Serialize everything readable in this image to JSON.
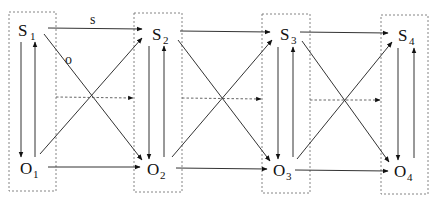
{
  "diagram": {
    "type": "state-observation transition diagram",
    "edge_labels": {
      "s": "s",
      "o": "o"
    },
    "time_slices": [
      {
        "index": 1,
        "state": {
          "base": "S",
          "sub": "1"
        },
        "observation": {
          "base": "O",
          "sub": "1"
        }
      },
      {
        "index": 2,
        "state": {
          "base": "S",
          "sub": "2"
        },
        "observation": {
          "base": "O",
          "sub": "2"
        }
      },
      {
        "index": 3,
        "state": {
          "base": "S",
          "sub": "3"
        },
        "observation": {
          "base": "O",
          "sub": "3"
        }
      },
      {
        "index": 4,
        "state": {
          "base": "S",
          "sub": "4"
        },
        "observation": {
          "base": "O",
          "sub": "4"
        }
      }
    ],
    "edges": [
      {
        "from": "S1",
        "to": "O1",
        "style": "solid"
      },
      {
        "from": "O1",
        "to": "S1",
        "style": "solid"
      },
      {
        "from": "S2",
        "to": "O2",
        "style": "solid"
      },
      {
        "from": "O2",
        "to": "S2",
        "style": "solid"
      },
      {
        "from": "S3",
        "to": "O3",
        "style": "solid"
      },
      {
        "from": "O3",
        "to": "S3",
        "style": "solid"
      },
      {
        "from": "S4",
        "to": "O4",
        "style": "solid"
      },
      {
        "from": "O4",
        "to": "S4",
        "style": "solid"
      },
      {
        "from": "S1",
        "to": "S2",
        "style": "solid",
        "label": "s"
      },
      {
        "from": "S2",
        "to": "S3",
        "style": "solid"
      },
      {
        "from": "S3",
        "to": "S4",
        "style": "solid"
      },
      {
        "from": "O1",
        "to": "O2",
        "style": "solid"
      },
      {
        "from": "O2",
        "to": "O3",
        "style": "solid"
      },
      {
        "from": "O3",
        "to": "O4",
        "style": "solid"
      },
      {
        "from": "S1",
        "to": "O2",
        "style": "solid",
        "label": "o"
      },
      {
        "from": "S2",
        "to": "O3",
        "style": "solid"
      },
      {
        "from": "S3",
        "to": "O4",
        "style": "solid"
      },
      {
        "from": "O1",
        "to": "S2",
        "style": "solid"
      },
      {
        "from": "O2",
        "to": "S3",
        "style": "solid"
      },
      {
        "from": "O3",
        "to": "S4",
        "style": "solid"
      },
      {
        "from": "Box1",
        "to": "Box2",
        "style": "dashed"
      },
      {
        "from": "Box2",
        "to": "Box3",
        "style": "dashed"
      },
      {
        "from": "Box3",
        "to": "Box4",
        "style": "dashed"
      }
    ]
  }
}
